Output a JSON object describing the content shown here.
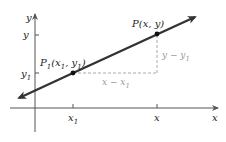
{
  "diagram": {
    "axes": {
      "x_label": "x",
      "y_label": "y"
    },
    "points": [
      {
        "name": "P1",
        "label": "P",
        "sub": "1",
        "coords_text": "(x",
        "coords_sub": "1",
        "coords_mid": ", y",
        "coords_sub2": "1",
        "coords_end": ")"
      },
      {
        "name": "P",
        "label": "P(x, y)"
      }
    ],
    "ticks": {
      "x": [
        {
          "label": "x",
          "sub": "1"
        },
        {
          "label": "x",
          "sub": ""
        }
      ],
      "y": [
        {
          "label": "y",
          "sub": ""
        },
        {
          "label": "y",
          "sub": "1"
        }
      ]
    },
    "run_label": {
      "text": "x − x",
      "sub": "1"
    },
    "rise_label": {
      "text": "y − y",
      "sub": "1"
    },
    "colors": {
      "line": "#333333",
      "axes": "#555555",
      "dashed": "#aaaaaa",
      "annotation": "#9a9a9a",
      "text": "#222222"
    }
  }
}
